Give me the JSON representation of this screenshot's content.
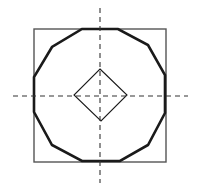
{
  "diagram": {
    "colors": {
      "background": "#ffffff",
      "stroke": "#1a1a1a",
      "square_stroke": "#555555",
      "axis_stroke": "#333333"
    },
    "square": {
      "x": 34,
      "y": 29,
      "width": 132,
      "height": 133,
      "stroke_width": 1.4
    },
    "dodecagon": {
      "points": "82,29 118,29 148,45 165,75 165,113 148,145 120,161 82,161 52,145 34,112 34,77 52,47",
      "stroke_width": 2.6
    },
    "diamond": {
      "points": "100,69 127,95 101,121 74,95",
      "stroke_width": 1.1
    },
    "axes": {
      "horizontal": {
        "x1": 13,
        "y1": 96,
        "x2": 188,
        "y2": 96
      },
      "vertical": {
        "x1": 100,
        "y1": 8,
        "x2": 100,
        "y2": 183
      },
      "dash": "5,4",
      "stroke_width": 1.1
    }
  }
}
